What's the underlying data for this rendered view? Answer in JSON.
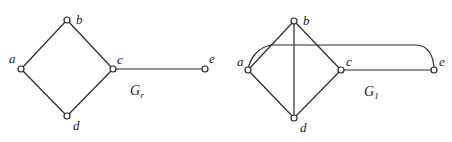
{
  "graphs": [
    {
      "name": "G",
      "subscript": "r",
      "vertices": [
        {
          "id": "a",
          "label": "a",
          "x": 21,
          "y": 69
        },
        {
          "id": "b",
          "label": "b",
          "x": 67,
          "y": 20
        },
        {
          "id": "c",
          "label": "c",
          "x": 113,
          "y": 69
        },
        {
          "id": "d",
          "label": "d",
          "x": 67,
          "y": 116
        },
        {
          "id": "e",
          "label": "e",
          "x": 205,
          "y": 69
        }
      ],
      "edges": [
        [
          "a",
          "b"
        ],
        [
          "b",
          "c"
        ],
        [
          "c",
          "d"
        ],
        [
          "d",
          "a"
        ],
        [
          "c",
          "e"
        ]
      ]
    },
    {
      "name": "G",
      "subscript": "1",
      "vertices": [
        {
          "id": "a",
          "label": "a",
          "x": 248,
          "y": 70
        },
        {
          "id": "b",
          "label": "b",
          "x": 294,
          "y": 21
        },
        {
          "id": "c",
          "label": "c",
          "x": 341,
          "y": 70
        },
        {
          "id": "d",
          "label": "d",
          "x": 294,
          "y": 118
        },
        {
          "id": "e",
          "label": "e",
          "x": 434,
          "y": 70
        }
      ],
      "edges": [
        [
          "a",
          "b"
        ],
        [
          "b",
          "c"
        ],
        [
          "c",
          "d"
        ],
        [
          "d",
          "a"
        ],
        [
          "c",
          "e"
        ],
        [
          "b",
          "d"
        ],
        [
          "a",
          "e",
          "curved"
        ]
      ]
    }
  ]
}
